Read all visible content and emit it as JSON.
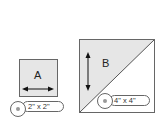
{
  "pieces": [
    {
      "id": "A",
      "label": "A",
      "size": "2\" x 2\"",
      "shape": "square",
      "grain": "horizontal"
    },
    {
      "id": "B",
      "label": "B",
      "size": "4\" x 4\"",
      "shape": "half-square-triangle",
      "grain": "vertical"
    }
  ],
  "colors": {
    "fill": "#e6e6e6",
    "stroke": "#666666",
    "white": "#ffffff"
  }
}
